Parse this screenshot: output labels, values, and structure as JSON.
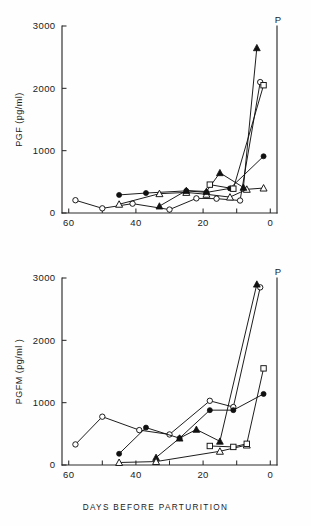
{
  "figure": {
    "xaxis_title": "DAYS BEFORE PARTURITION",
    "parturition_marker": "P"
  },
  "panels": {
    "top": {
      "ylabel": "PGF (pg/ml)",
      "ytick_labels": [
        "3000",
        "2000",
        "1000",
        "0"
      ],
      "xtick_labels": [
        "60",
        "40",
        "20",
        "0"
      ],
      "parturition_marker": "P"
    },
    "bottom": {
      "ylabel": "PGFM (pg/ml )",
      "ytick_labels": [
        "3000",
        "2000",
        "1000",
        "0"
      ],
      "xtick_labels": [
        "60",
        "40",
        "20",
        "0"
      ],
      "parturition_marker": "P"
    }
  },
  "chart_data": [
    {
      "type": "line",
      "title": "PGF before parturition",
      "xlabel": "DAYS BEFORE PARTURITION",
      "ylabel": "PGF (pg/ml)",
      "xlim": [
        62,
        -2
      ],
      "ylim": [
        0,
        3000
      ],
      "x_reversed": true,
      "grid": false,
      "legend": "none",
      "xticks": [
        60,
        50,
        40,
        30,
        20,
        10,
        0
      ],
      "xtick_labels": [
        "60",
        "",
        "40",
        "",
        "20",
        "",
        "0"
      ],
      "yticks": [
        0,
        1000,
        2000,
        3000
      ],
      "annotations": [
        {
          "text": "P",
          "x": 0,
          "y": 3000,
          "position": "above-right-axis"
        }
      ],
      "series": [
        {
          "name": "animal-1",
          "marker": "open-circle",
          "x": [
            58,
            50,
            41,
            30,
            22,
            16,
            9,
            3
          ],
          "y": [
            205,
            75,
            150,
            55,
            235,
            230,
            200,
            2100
          ]
        },
        {
          "name": "animal-2",
          "marker": "filled-circle",
          "x": [
            45,
            37,
            25,
            19,
            12,
            2
          ],
          "y": [
            290,
            320,
            355,
            330,
            395,
            910
          ]
        },
        {
          "name": "animal-3",
          "marker": "open-triangle",
          "x": [
            45,
            33,
            25,
            19,
            12,
            7,
            2
          ],
          "y": [
            140,
            310,
            330,
            300,
            255,
            380,
            400
          ]
        },
        {
          "name": "animal-4",
          "marker": "filled-triangle",
          "x": [
            33,
            25,
            19,
            15,
            8,
            4
          ],
          "y": [
            110,
            360,
            345,
            645,
            410,
            2650
          ]
        },
        {
          "name": "animal-5",
          "marker": "open-square",
          "x": [
            18,
            11,
            2
          ],
          "y": [
            455,
            390,
            2050
          ]
        }
      ]
    },
    {
      "type": "line",
      "title": "PGFM before parturition",
      "xlabel": "DAYS BEFORE PARTURITION",
      "ylabel": "PGFM (pg/ml )",
      "xlim": [
        62,
        -2
      ],
      "ylim": [
        0,
        3000
      ],
      "x_reversed": true,
      "grid": false,
      "legend": "none",
      "xticks": [
        60,
        50,
        40,
        30,
        20,
        10,
        0
      ],
      "xtick_labels": [
        "60",
        "",
        "40",
        "",
        "20",
        "",
        "0"
      ],
      "yticks": [
        0,
        1000,
        2000,
        3000
      ],
      "annotations": [
        {
          "text": "P",
          "x": 0,
          "y": 3000,
          "position": "above-right-axis"
        }
      ],
      "series": [
        {
          "name": "animal-1",
          "marker": "open-circle",
          "x": [
            58,
            50,
            39,
            30,
            18,
            11,
            3
          ],
          "y": [
            330,
            775,
            560,
            490,
            1030,
            930,
            2850
          ]
        },
        {
          "name": "animal-2",
          "marker": "filled-circle",
          "x": [
            45,
            37,
            27,
            18,
            11,
            2
          ],
          "y": [
            180,
            600,
            430,
            880,
            880,
            1140
          ]
        },
        {
          "name": "animal-3",
          "marker": "filled-triangle",
          "x": [
            34,
            27,
            22,
            15,
            4
          ],
          "y": [
            120,
            430,
            570,
            380,
            2900
          ]
        },
        {
          "name": "animal-4",
          "marker": "open-triangle",
          "x": [
            45,
            34,
            15,
            7
          ],
          "y": [
            40,
            55,
            220,
            320
          ]
        },
        {
          "name": "animal-5",
          "marker": "open-square",
          "x": [
            18,
            11,
            7,
            2
          ],
          "y": [
            305,
            290,
            340,
            1550
          ]
        }
      ]
    }
  ]
}
